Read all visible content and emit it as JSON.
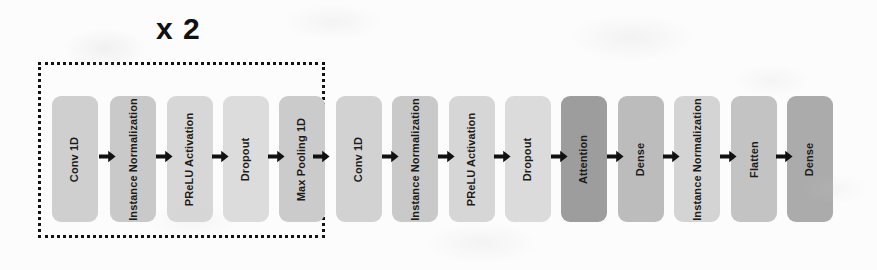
{
  "diagram": {
    "type": "neural-network-architecture-pipeline",
    "background_color": "#fcfcfc",
    "arrow_color": "#111111",
    "canvas": {
      "width": 877,
      "height": 270
    },
    "repeat_group": {
      "label": "x 2",
      "border_style": "dotted",
      "border_color": "#121212",
      "x": 38,
      "y": 62,
      "width": 287,
      "height": 176,
      "label_x": 156,
      "label_y": 12,
      "label_font_size": 30,
      "covers_blocks": [
        0,
        1,
        2,
        3,
        4
      ]
    },
    "block_geometry": {
      "top": 96,
      "height": 126,
      "width": 46
    },
    "palette": {
      "light_gray": "#dadada",
      "medium_gray": "#c6c6c6",
      "mid_gray": "#bdbdbd",
      "dark_gray": "#9e9e9e",
      "darker_gray": "#a8a8a8",
      "text": "#1b1b1b"
    },
    "blocks": [
      {
        "label": "Conv 1D",
        "color": "#cfcfcf",
        "x": 52,
        "font_size": 11
      },
      {
        "label": "Instance Normalization",
        "color": "#c9c9c9",
        "x": 110,
        "font_size": 11
      },
      {
        "label": "PReLU Activation",
        "color": "#d7d7d7",
        "x": 167,
        "font_size": 11
      },
      {
        "label": "Dropout",
        "color": "#dcdcdc",
        "x": 223,
        "font_size": 11
      },
      {
        "label": "Max Pooling 1D",
        "color": "#cbcbcb",
        "x": 279,
        "font_size": 11
      },
      {
        "label": "Conv 1D",
        "color": "#d2d2d2",
        "x": 336,
        "font_size": 11
      },
      {
        "label": "Instance Normalization",
        "color": "#c9c9c9",
        "x": 392,
        "font_size": 11
      },
      {
        "label": "PReLU Activation",
        "color": "#d6d6d6",
        "x": 449,
        "font_size": 11
      },
      {
        "label": "Dropout",
        "color": "#dbdbdb",
        "x": 505,
        "font_size": 11
      },
      {
        "label": "Attention",
        "color": "#9d9d9d",
        "x": 561,
        "font_size": 11
      },
      {
        "label": "Dense",
        "color": "#bcbcbc",
        "x": 618,
        "font_size": 11
      },
      {
        "label": "Instance Normalization",
        "color": "#d4d4d4",
        "x": 674,
        "font_size": 11
      },
      {
        "label": "Flatten",
        "color": "#c3c3c3",
        "x": 731,
        "font_size": 11
      },
      {
        "label": "Dense",
        "color": "#ababab",
        "x": 787,
        "font_size": 11
      }
    ],
    "arrows": [
      {
        "from": "Conv 1D",
        "to": "Instance Normalization",
        "x": 99,
        "y": 156
      },
      {
        "from": "Instance Normalization",
        "to": "PReLU Activation",
        "x": 156,
        "y": 156
      },
      {
        "from": "PReLU Activation",
        "to": "Dropout",
        "x": 212,
        "y": 156
      },
      {
        "from": "Dropout",
        "to": "Max Pooling 1D",
        "x": 268,
        "y": 156
      },
      {
        "from": "Max Pooling 1D",
        "to": "Conv 1D",
        "x": 313,
        "y": 156
      },
      {
        "from": "Conv 1D",
        "to": "Instance Normalization",
        "x": 382,
        "y": 156
      },
      {
        "from": "Instance Normalization",
        "to": "PReLU Activation",
        "x": 438,
        "y": 156
      },
      {
        "from": "PReLU Activation",
        "to": "Dropout",
        "x": 494,
        "y": 156
      },
      {
        "from": "Dropout",
        "to": "Attention",
        "x": 551,
        "y": 156
      },
      {
        "from": "Attention",
        "to": "Dense",
        "x": 607,
        "y": 156
      },
      {
        "from": "Dense",
        "to": "Instance Normalization",
        "x": 663,
        "y": 156
      },
      {
        "from": "Instance Normalization",
        "to": "Flatten",
        "x": 720,
        "y": 156
      },
      {
        "from": "Flatten",
        "to": "Dense",
        "x": 776,
        "y": 156
      }
    ]
  }
}
